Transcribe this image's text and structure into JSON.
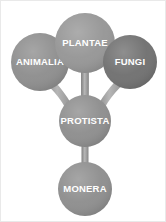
{
  "diagram": {
    "background_color": "#ffffff",
    "border_color": "#e9e9e9",
    "label_color": "#ffffff",
    "stem_color": "#9a9a9a",
    "nodes": [
      {
        "id": "animalia",
        "label": "ANIMALIA",
        "cx": 39,
        "cy": 61,
        "r": 29,
        "fill": "#8d8d8d",
        "font_size": 9.5
      },
      {
        "id": "plantae",
        "label": "PLANTAE",
        "cx": 84,
        "cy": 42,
        "r": 30,
        "fill": "#959595",
        "font_size": 9.5
      },
      {
        "id": "fungi",
        "label": "FUNGI",
        "cx": 129,
        "cy": 61,
        "r": 27,
        "fill": "#6f6f6f",
        "font_size": 9.5
      },
      {
        "id": "protista",
        "label": "PROTISTA",
        "cx": 84,
        "cy": 120,
        "r": 26,
        "fill": "#8d8d8d",
        "font_size": 9.5
      },
      {
        "id": "monera",
        "label": "MONERA",
        "cx": 84,
        "cy": 188,
        "r": 27,
        "fill": "#8d8d8d",
        "font_size": 9.5
      }
    ],
    "connectors": [
      {
        "id": "protista-to-animalia",
        "from": "protista",
        "to": "animalia"
      },
      {
        "id": "protista-to-plantae",
        "from": "protista",
        "to": "plantae"
      },
      {
        "id": "protista-to-fungi",
        "from": "protista",
        "to": "fungi"
      },
      {
        "id": "protista-to-monera",
        "from": "protista",
        "to": "monera"
      }
    ]
  }
}
